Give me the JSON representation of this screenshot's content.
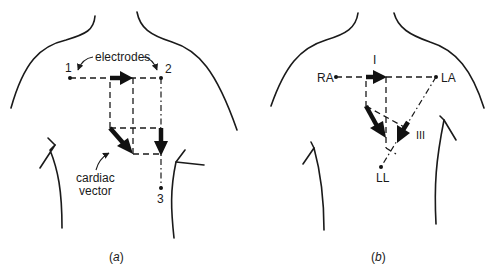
{
  "panels": {
    "a": {
      "caption_open": "(",
      "caption_letter": "a",
      "caption_close": ")",
      "electrodes_label": "electrodes",
      "electrode_1": "1",
      "electrode_2": "2",
      "electrode_3": "3",
      "vector_label_line1": "cardiac",
      "vector_label_line2": "vector"
    },
    "b": {
      "caption_open": "(",
      "caption_letter": "b",
      "caption_close": ")",
      "lead_I": "I",
      "lead_III": "III",
      "electrode_RA": "RA",
      "electrode_LA": "LA",
      "electrode_LL": "LL"
    }
  },
  "colors": {
    "line": "#1a1a1a",
    "background": "#ffffff"
  }
}
